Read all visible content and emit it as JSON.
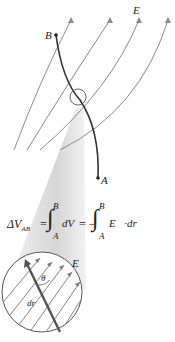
{
  "labels": {
    "field": "E⃗",
    "point_b": "B",
    "point_a": "A",
    "circle_field": "E⃗",
    "angle": "θ",
    "displacement": "dr⃗"
  },
  "equation": {
    "lhs": "ΔV",
    "lhs_sub": "AB",
    "eq1": "=",
    "int1_upper": "B",
    "int1_lower": "A",
    "integrand1": "dV",
    "eq2": "= −",
    "int2_upper": "B",
    "int2_lower": "A",
    "integrand2": "E⃗·dr⃗"
  },
  "colors": {
    "field_lines": "#8a8a8a",
    "path": "#333333",
    "cone": "#dcdcdc"
  }
}
